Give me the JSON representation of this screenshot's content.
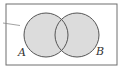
{
  "diagram": {
    "type": "venn",
    "sets": [
      {
        "label": "A",
        "cx": 46,
        "cy": 35,
        "r": 22
      },
      {
        "label": "B",
        "cx": 77,
        "cy": 35,
        "r": 22
      }
    ],
    "shaded": [
      "A",
      "B",
      "A∩B"
    ],
    "colors": {
      "frame": "#6e6e6e",
      "circle_stroke": "#555555",
      "fill": "#dcdcdc",
      "background": "#ffffff",
      "label": "#333333"
    }
  }
}
